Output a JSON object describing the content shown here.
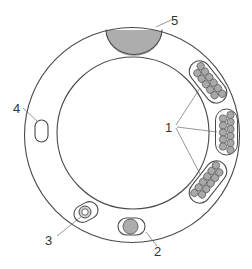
{
  "diagram": {
    "type": "cross-section",
    "colors": {
      "line": "#4a4a4a",
      "fill_gray": "#adadad",
      "background": "#ffffff"
    },
    "labels": [
      {
        "id": "1",
        "text": "1",
        "target": "strand-bundles"
      },
      {
        "id": "2",
        "text": "2",
        "target": "solid-core-conduit"
      },
      {
        "id": "3",
        "text": "3",
        "target": "hollow-tube-conduit"
      },
      {
        "id": "4",
        "text": "4",
        "target": "empty-channel"
      },
      {
        "id": "5",
        "text": "5",
        "target": "top-gray-segment"
      }
    ]
  }
}
